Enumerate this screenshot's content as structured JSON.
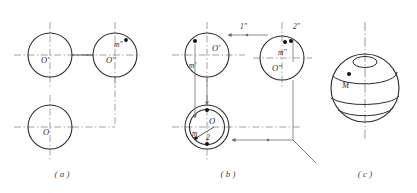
{
  "figure": {
    "background_color": "#ffffff",
    "outline_color": "#2b2b2b",
    "construction_color": "#8a8a8a",
    "projection_color": "#6f6f6f",
    "panels": [
      {
        "id": "a",
        "caption": "( a )",
        "labels": {
          "top_left_circle": "O′",
          "top_right_circle": "O″",
          "bottom_circle": "O",
          "point_front": "m″"
        }
      },
      {
        "id": "b",
        "caption": "( b )",
        "labels": {
          "top_left_circle": "O′",
          "top_left_point": "m′",
          "top_right_circle": "O″",
          "top_right_point": "m″",
          "bottom_circle": "O",
          "bottom_point": "m",
          "ray_one": "1″",
          "ray_two": "2″",
          "bottom_index": "2"
        }
      },
      {
        "id": "c",
        "caption": "( c )",
        "labels": {
          "point": "M"
        }
      }
    ]
  },
  "captions": {
    "a": "( a )",
    "b": "( b )",
    "c": "( c )"
  },
  "panel_a": {
    "top_left_circle": "O′",
    "top_right_circle": "O″",
    "bottom_circle": "O",
    "point_front": "m″"
  },
  "panel_b": {
    "top_left_circle": "O′",
    "top_left_point": "m′",
    "top_right_circle": "O″",
    "top_right_point": "m″",
    "bottom_circle": "O",
    "bottom_point": "m",
    "ray_one": "1″",
    "ray_two": "2″",
    "bottom_index": "2"
  },
  "panel_c": {
    "point": "M"
  }
}
